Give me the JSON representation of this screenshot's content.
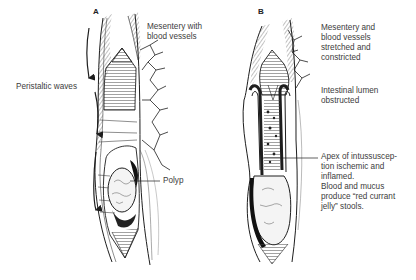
{
  "figure": {
    "panels": [
      {
        "letter": "A",
        "labels": {
          "mesentery": "Mesentery with\nblood vessels",
          "peristalsis": "Peristaltic waves",
          "polyp": "Polyp"
        }
      },
      {
        "letter": "B",
        "labels": {
          "mesentery": "Mesentery and\nblood vessels\nstretched and\nconstricted",
          "lumen": "Intestinal lumen\nobstructed",
          "apex": "Apex of intussuscep-\ntion ischemic and\ninflamed.\nBlood and mucus\nproduce “red currant\njelly” stools."
        }
      }
    ],
    "colors": {
      "ink": "#1e1e1e",
      "label_text": "#3c3c3c",
      "background": "#ffffff"
    }
  }
}
